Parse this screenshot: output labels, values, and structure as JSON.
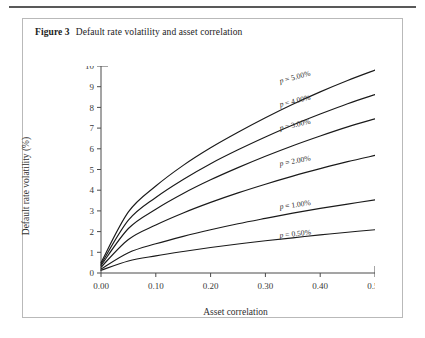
{
  "top_rule": {
    "color": "#595959"
  },
  "caption": {
    "label": "Figure 3",
    "text": "Default rate volatility and asset correlation"
  },
  "axis_titles": {
    "x": "Asset correlation",
    "y": "Default rate volatility (%)"
  },
  "chart_data": {
    "type": "line",
    "title": "Default rate volatility and asset correlation",
    "xlabel": "Asset correlation",
    "ylabel": "Default rate volatility (%)",
    "xlim": [
      0.0,
      0.5
    ],
    "ylim": [
      0,
      10
    ],
    "xticks": [
      0.0,
      0.1,
      0.2,
      0.3,
      0.4,
      0.5
    ],
    "xticklabels": [
      "0.00",
      "0.10",
      "0.20",
      "0.30",
      "0.40",
      "0.50"
    ],
    "yticks": [
      0,
      1,
      2,
      3,
      4,
      5,
      6,
      7,
      8,
      9,
      10
    ],
    "yticklabels": [
      "0",
      "1",
      "2",
      "3",
      "4",
      "5",
      "6",
      "7",
      "8",
      "9",
      "10"
    ],
    "grid": false,
    "legend": "inline-curve-labels",
    "line_color": "#1a1a1a",
    "x": [
      0.0,
      0.05,
      0.1,
      0.15,
      0.2,
      0.25,
      0.3,
      0.35,
      0.4,
      0.45,
      0.5
    ],
    "series": [
      {
        "name": "p = 5.00%",
        "label": "p = 5.00%",
        "p": 5.0,
        "values": [
          0.5,
          2.95,
          4.2,
          5.2,
          6.05,
          6.8,
          7.5,
          8.15,
          8.75,
          9.3,
          9.8
        ]
      },
      {
        "name": "p = 4.00%",
        "label": "p = 4.00%",
        "p": 4.0,
        "values": [
          0.42,
          2.55,
          3.65,
          4.52,
          5.28,
          5.95,
          6.57,
          7.15,
          7.68,
          8.18,
          8.62
        ]
      },
      {
        "name": "p = 3.00%",
        "label": "p = 3.00%",
        "p": 3.0,
        "values": [
          0.36,
          2.15,
          3.08,
          3.84,
          4.5,
          5.09,
          5.64,
          6.15,
          6.62,
          7.06,
          7.45
        ]
      },
      {
        "name": "p = 2.00%",
        "label": "p = 2.00%",
        "p": 2.0,
        "values": [
          0.28,
          1.62,
          2.32,
          2.9,
          3.41,
          3.87,
          4.29,
          4.68,
          5.04,
          5.38,
          5.68
        ]
      },
      {
        "name": "p = 1.00%",
        "label": "p = 1.00%",
        "p": 1.0,
        "values": [
          0.19,
          0.98,
          1.41,
          1.77,
          2.09,
          2.38,
          2.64,
          2.89,
          3.12,
          3.33,
          3.53
        ]
      },
      {
        "name": "p = 0.50%",
        "label": "p = 0.50%",
        "p": 0.5,
        "values": [
          0.13,
          0.58,
          0.83,
          1.04,
          1.23,
          1.4,
          1.56,
          1.7,
          1.84,
          1.97,
          2.09
        ]
      }
    ],
    "series_label_positions": [
      {
        "x": 0.355,
        "y": 9.35,
        "angle": -15
      },
      {
        "x": 0.355,
        "y": 8.2,
        "angle": -14
      },
      {
        "x": 0.355,
        "y": 7.05,
        "angle": -13
      },
      {
        "x": 0.355,
        "y": 5.3,
        "angle": -11
      },
      {
        "x": 0.355,
        "y": 3.18,
        "angle": -8
      },
      {
        "x": 0.355,
        "y": 1.78,
        "angle": -6
      }
    ]
  }
}
